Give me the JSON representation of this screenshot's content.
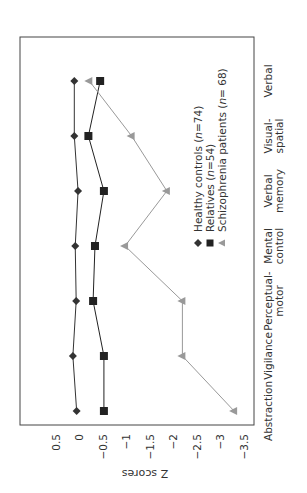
{
  "chart_data": {
    "type": "line",
    "orientation": "rotated 90 degrees (page printed sideways)",
    "title": "",
    "xlabel": "",
    "ylabel": "Z scores",
    "ylim": [
      -3.5,
      0.5
    ],
    "yticks": [
      0.5,
      0,
      -0.5,
      -1,
      -1.5,
      -2,
      -2.5,
      -3,
      -3.5
    ],
    "ytick_labels": [
      "0.5",
      "0",
      "−0.5",
      "−1",
      "−1.5",
      "−2",
      "−2.5",
      "−3",
      "−3.5"
    ],
    "categories": [
      "Abstraction",
      "Vigilance",
      "Perceptual-motor",
      "Mental control",
      "Verbal memory",
      "Visual-spatial",
      "Verbal"
    ],
    "category_labels": [
      [
        "Abstraction"
      ],
      [
        "Vigilance"
      ],
      [
        "Perceptual-",
        "motor"
      ],
      [
        "Mental",
        "control"
      ],
      [
        "Verbal",
        "memory"
      ],
      [
        "Visual-",
        "spatial"
      ],
      [
        "Verbal"
      ]
    ],
    "series": [
      {
        "name": "Healthy controls (n=74)",
        "label_prefix": "Healthy controls (",
        "label_n": "n",
        "label_suffix": "=74)",
        "marker": "diamond",
        "color": "#333333",
        "values": [
          0.05,
          0.13,
          0.06,
          0.08,
          0.02,
          0.1,
          0.1
        ]
      },
      {
        "name": "Relatives (n=54)",
        "label_prefix": "Relatives (",
        "label_n": "n",
        "label_suffix": "=54)",
        "marker": "square",
        "color": "#222222",
        "values": [
          -0.53,
          -0.53,
          -0.3,
          -0.34,
          -0.53,
          -0.2,
          -0.45
        ]
      },
      {
        "name": "Schizophrenia patients (n=68)",
        "label_prefix": "Schizophrenia patients (",
        "label_n": "n",
        "label_suffix": "= 68)",
        "marker": "triangle",
        "color": "#999999",
        "values": [
          -3.3,
          -2.2,
          -2.2,
          -0.98,
          -1.87,
          -1.12,
          -0.22
        ]
      }
    ],
    "grid": false,
    "legend_position": "inside plot, lower right of rotated frame"
  }
}
